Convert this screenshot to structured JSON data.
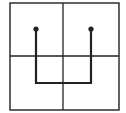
{
  "diagram": {
    "grid": {
      "rows": 2,
      "cols": 2,
      "left": 10,
      "top": 3,
      "right": 119,
      "bottom": 110,
      "mid_x": 63,
      "mid_y": 56
    },
    "path": {
      "points": [
        [
          36,
          29
        ],
        [
          36,
          83
        ],
        [
          91,
          83
        ],
        [
          91,
          29
        ]
      ],
      "stroke": "#222222",
      "width": 2.2
    },
    "dots": [
      {
        "x": 36,
        "y": 29
      },
      {
        "x": 91,
        "y": 29
      }
    ],
    "colors": {
      "line": "#222222",
      "background": "#ffffff"
    }
  }
}
